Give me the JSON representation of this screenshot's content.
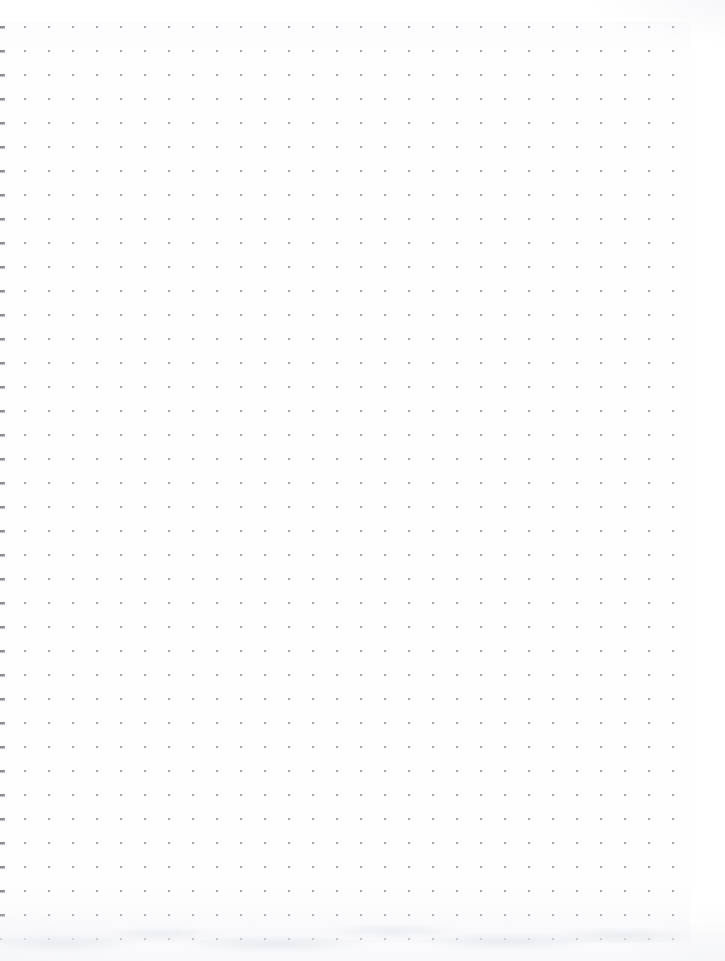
{
  "document": {
    "type": "dot-grid-paper-scan",
    "title": "Blank Dot Grid Page",
    "page_width": 725,
    "page_height": 961,
    "background_color": "#fefeff",
    "has_text_content": false,
    "has_handwriting": false,
    "visible_text": ""
  },
  "grid": {
    "name": "dot-grid",
    "pitch_px": 24,
    "dot_size_px": 2,
    "dot_color": "#969 69e",
    "dot_color_hex": "#96969e",
    "origin_x_px": 1,
    "origin_y_px": 27,
    "columns": 29,
    "rows": 38,
    "first_dot_x_px": 1,
    "first_dot_y_px": 27,
    "last_dot_x_px": 677,
    "last_dot_y_px": 931
  },
  "margins": {
    "top_px": 26,
    "left_px": 0,
    "right_px": 48,
    "bottom_px": 30
  },
  "artifacts": {
    "left_edge_marks": {
      "name": "clipped-edge-dots",
      "description": "darker clipped dot marks along the left scan edge",
      "color_hex": "#8a8a94",
      "x_px": 0,
      "width_px": 3
    },
    "bottom_texture": {
      "name": "paper-scan-texture",
      "description": "faint mottled paper texture and shadow below the last dot row",
      "color_hex": "#e9ebf0",
      "top_px": 938,
      "height_px": 23
    }
  }
}
